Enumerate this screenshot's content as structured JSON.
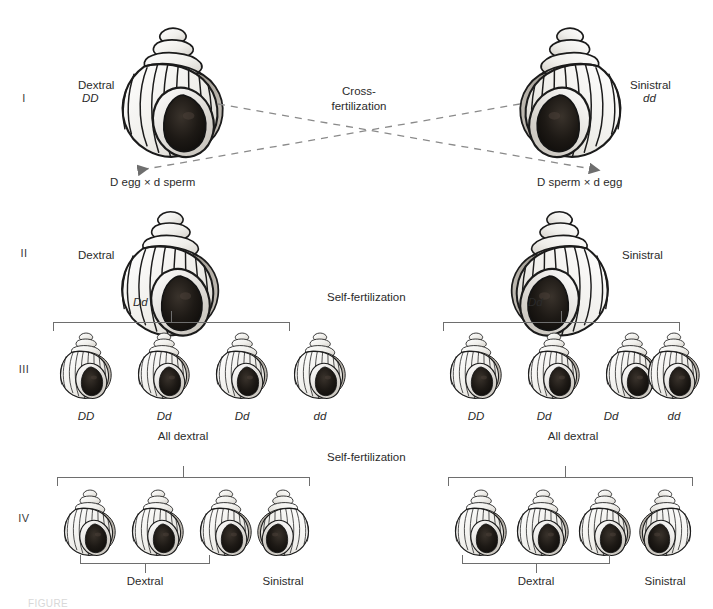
{
  "figure": {
    "bottom_caption": "FIGURE"
  },
  "generations": {
    "labels": [
      "I",
      "II",
      "III",
      "IV"
    ]
  },
  "generation_1": {
    "left": {
      "phenotype": "Dextral",
      "genotype": "DD"
    },
    "right": {
      "phenotype": "Sinistral",
      "genotype": "dd"
    },
    "cross_label_line1": "Cross-",
    "cross_label_line2": "fertilization",
    "gamete_left": "D egg × d sperm",
    "gamete_right": "D sperm × d egg"
  },
  "generation_2": {
    "left": {
      "phenotype": "Dextral",
      "genotype": "Dd"
    },
    "right": {
      "phenotype": "Sinistral",
      "genotype": "Dd"
    },
    "self_fertilization": "Self-fertilization"
  },
  "generation_3": {
    "left": {
      "genotypes": [
        "DD",
        "Dd",
        "Dd",
        "dd"
      ],
      "phenotype_summary": "All dextral"
    },
    "right": {
      "genotypes": [
        "DD",
        "Dd",
        "Dd",
        "dd"
      ],
      "phenotype_summary": "All dextral"
    },
    "self_fertilization": "Self-fertilization"
  },
  "generation_4": {
    "left": {
      "group_label": "Dextral",
      "single_label": "Sinistral"
    },
    "right": {
      "group_label": "Dextral",
      "single_label": "Sinistral"
    }
  },
  "colors": {
    "ink": "#231f20",
    "line": "#6e6e6e",
    "aperture_dark": "#1a1613",
    "shell_light": "#f2f1ee",
    "shell_shadow": "#9a958e"
  }
}
